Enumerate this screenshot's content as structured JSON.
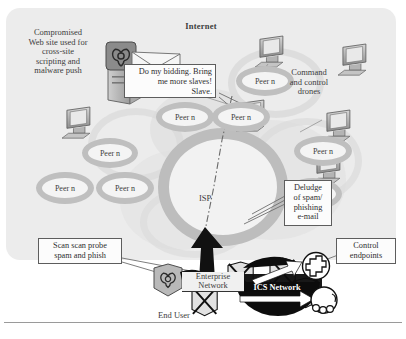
{
  "diagram": {
    "title_internet": "Internet",
    "labels": {
      "compromised": "Compromised\nWeb site used for\ncross-site\nscripting and\nmalware push",
      "command_control": "Command\nand control\ndrones",
      "isp": "ISP",
      "end_user": "End User",
      "enterprise_network": "Enterprise\nNetwork",
      "ics_network": "ICS Network"
    },
    "callouts": [
      {
        "id": "speech-bubble",
        "text": "Do my bidding. Bring\nme more slaves!\nSlave."
      },
      {
        "id": "scan-probe",
        "text": "Scan scan probe\nspam and phish"
      },
      {
        "id": "spam-deluge",
        "text": "Deludge\nof spam/\nphishing\ne-mail"
      },
      {
        "id": "control-endpoints",
        "text": "Control\nendpoints"
      }
    ],
    "peers": [
      {
        "id": "peer-1",
        "label": "Peer n"
      },
      {
        "id": "peer-2",
        "label": "Peer n"
      },
      {
        "id": "peer-3",
        "label": "Peer n"
      },
      {
        "id": "peer-4",
        "label": "Peer n"
      },
      {
        "id": "peer-5",
        "label": "Peer n"
      },
      {
        "id": "peer-6",
        "label": "Peer n"
      },
      {
        "id": "peer-7",
        "label": "Peer n"
      },
      {
        "id": "peer-8",
        "label": "Peer n"
      },
      {
        "id": "peer-9",
        "label": "Peer n"
      }
    ],
    "icons": {
      "biohazard_server": "biohazard-server-icon",
      "biohazard_endpoint": "biohazard-endpoint-icon",
      "workstation": "workstation-icon",
      "control_endpoint": "control-endpoint-icon"
    },
    "colors": {
      "panel_bg": "#ececec",
      "peer_ring": "#bfbfbf",
      "cloud_ring": "#d9d9d9",
      "text": "#3c3c3c",
      "dark_fill": "#101010",
      "callout_border": "#5d5d5d"
    }
  }
}
